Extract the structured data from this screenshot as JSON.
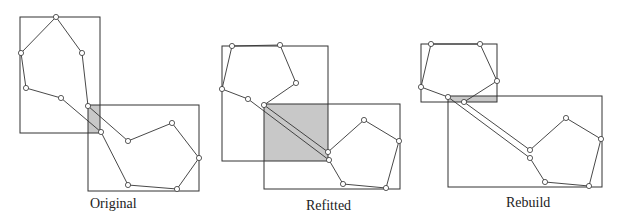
{
  "panels": [
    {
      "label": "Original",
      "label_pos": [
        90,
        196
      ],
      "rects": [
        [
          20,
          17,
          80,
          116
        ],
        [
          88,
          105,
          111,
          86
        ]
      ],
      "overlap": [
        [
          88,
          105
        ],
        [
          100,
          105
        ],
        [
          100,
          133
        ],
        [
          88,
          133
        ]
      ],
      "polyline_a": [
        [
          101,
          132
        ],
        [
          61,
          98
        ],
        [
          26,
          88
        ],
        [
          21,
          53
        ],
        [
          56,
          17
        ],
        [
          82,
          53
        ],
        [
          88,
          106
        ],
        [
          128,
          141
        ],
        [
          172,
          123
        ],
        [
          199,
          158
        ],
        [
          177,
          189
        ],
        [
          128,
          185
        ],
        [
          101,
          132
        ]
      ],
      "vertices": [
        [
          56,
          17
        ],
        [
          21,
          53
        ],
        [
          82,
          53
        ],
        [
          26,
          88
        ],
        [
          61,
          98
        ],
        [
          88,
          106
        ],
        [
          101,
          132
        ],
        [
          128,
          141
        ],
        [
          172,
          123
        ],
        [
          199,
          158
        ],
        [
          177,
          189
        ],
        [
          128,
          185
        ]
      ]
    },
    {
      "label": "Refitted",
      "label_pos": [
        306,
        198
      ],
      "rects": [
        [
          222,
          46,
          106,
          115
        ],
        [
          264,
          104,
          136,
          85
        ]
      ],
      "overlap": [
        [
          264,
          104
        ],
        [
          328,
          104
        ],
        [
          328,
          161
        ],
        [
          264,
          161
        ]
      ],
      "polyline_a": [
        [
          329,
          160
        ],
        [
          248,
          99
        ],
        [
          222,
          89
        ],
        [
          232,
          46
        ],
        [
          280,
          45
        ],
        [
          296,
          83
        ],
        [
          264,
          105
        ],
        [
          328,
          152
        ],
        [
          364,
          120
        ],
        [
          399,
          141
        ],
        [
          386,
          188
        ],
        [
          343,
          184
        ],
        [
          329,
          160
        ]
      ],
      "vertices": [
        [
          232,
          46
        ],
        [
          280,
          45
        ],
        [
          296,
          83
        ],
        [
          222,
          89
        ],
        [
          248,
          99
        ],
        [
          264,
          105
        ],
        [
          328,
          152
        ],
        [
          329,
          160
        ],
        [
          364,
          120
        ],
        [
          399,
          141
        ],
        [
          343,
          184
        ],
        [
          386,
          188
        ]
      ]
    },
    {
      "label": "Rebuild",
      "label_pos": [
        506,
        195
      ],
      "rects": [
        [
          421,
          44,
          76,
          58
        ],
        [
          448,
          96,
          154,
          91
        ]
      ],
      "overlap": [
        [
          448,
          96
        ],
        [
          497,
          96
        ],
        [
          497,
          102
        ],
        [
          448,
          102
        ]
      ],
      "polyline_a": [
        [
          530,
          158
        ],
        [
          448,
          97
        ],
        [
          421,
          87
        ],
        [
          431,
          44
        ],
        [
          480,
          44
        ],
        [
          497,
          81
        ],
        [
          464,
          102
        ],
        [
          530,
          150
        ],
        [
          566,
          118
        ],
        [
          601,
          139
        ],
        [
          589,
          186
        ],
        [
          545,
          182
        ],
        [
          530,
          158
        ]
      ],
      "vertices": [
        [
          431,
          44
        ],
        [
          480,
          44
        ],
        [
          497,
          81
        ],
        [
          421,
          87
        ],
        [
          448,
          97
        ],
        [
          464,
          102
        ],
        [
          530,
          150
        ],
        [
          530,
          158
        ],
        [
          566,
          118
        ],
        [
          601,
          139
        ],
        [
          545,
          182
        ],
        [
          589,
          186
        ]
      ]
    }
  ],
  "colors": {
    "stroke": "#333333",
    "overlap_fill": "#c8c8c8",
    "vertex_fill": "#ffffff"
  }
}
